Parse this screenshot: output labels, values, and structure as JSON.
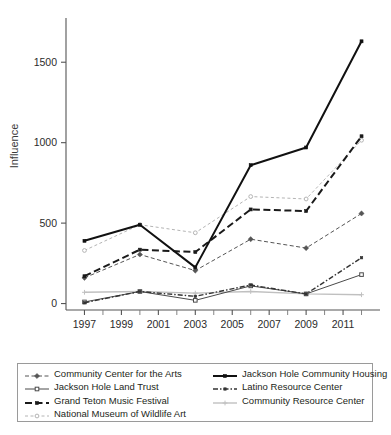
{
  "chart_data": {
    "type": "line",
    "title": "",
    "xlabel": "",
    "ylabel": "Influence",
    "x": [
      1997,
      1998,
      1999,
      2000,
      2001,
      2002,
      2003,
      2004,
      2005,
      2006,
      2007,
      2008,
      2009,
      2010,
      2011,
      2012
    ],
    "x_tick_labels": [
      "1997",
      "1999",
      "2001",
      "2003",
      "2005",
      "2007",
      "2009",
      "2011"
    ],
    "x_ticks": [
      1997,
      1999,
      2001,
      2003,
      2005,
      2007,
      2009,
      2011
    ],
    "xlim": [
      1996,
      2013
    ],
    "y_tick_labels": [
      "0",
      "500",
      "1000",
      "1500"
    ],
    "y_ticks": [
      0,
      500,
      1000,
      1500
    ],
    "ylim": [
      -40,
      1750
    ],
    "grid": false,
    "legend_position": "below",
    "series": [
      {
        "name": "Community Center for the Arts",
        "style": "dashed-thin",
        "color": "#555555",
        "marker": "diamond",
        "x": [
          1997,
          2000,
          2003,
          2006,
          2009,
          2012
        ],
        "values": [
          160,
          305,
          205,
          400,
          345,
          560
        ]
      },
      {
        "name": "Jackson Hole Land Trust",
        "style": "solid-thin",
        "color": "#4a4a4a",
        "marker": "square-open",
        "x": [
          1997,
          2000,
          2003,
          2006,
          2009,
          2012
        ],
        "values": [
          10,
          75,
          20,
          110,
          60,
          180
        ]
      },
      {
        "name": "Grand Teton Music Festival",
        "style": "dashed-bold",
        "color": "#1a1a1a",
        "marker": "square",
        "x": [
          1997,
          2000,
          2003,
          2006,
          2009,
          2012
        ],
        "values": [
          170,
          335,
          320,
          585,
          575,
          1040
        ]
      },
      {
        "name": "National Museum of Wildlife Art",
        "style": "dotted-light",
        "color": "#b4b4b4",
        "marker": "circle-open",
        "x": [
          1997,
          2000,
          2003,
          2006,
          2009,
          2012
        ],
        "values": [
          330,
          490,
          440,
          665,
          650,
          1015
        ]
      },
      {
        "name": "Jackson Hole Community Housing",
        "style": "solid-bold",
        "color": "#111111",
        "marker": "square",
        "x": [
          1997,
          2000,
          2003,
          2006,
          2009,
          2012
        ],
        "values": [
          390,
          490,
          225,
          860,
          970,
          1630
        ]
      },
      {
        "name": "Latino Resource Center",
        "style": "dash-dot",
        "color": "#333333",
        "marker": "square-small",
        "x": [
          1997,
          2000,
          2003,
          2006,
          2009,
          2012
        ],
        "values": [
          5,
          75,
          45,
          115,
          60,
          285
        ]
      },
      {
        "name": "Community Resource Center",
        "style": "solid-grey",
        "color": "#c0c0c0",
        "marker": "plus",
        "x": [
          1997,
          2000,
          2003,
          2006,
          2009,
          2012
        ],
        "values": [
          70,
          75,
          65,
          75,
          60,
          55
        ]
      }
    ]
  },
  "legend": {
    "left_column": [
      "Community Center for the Arts",
      "Jackson Hole Land Trust",
      "Grand Teton Music Festival",
      "National Museum of Wildlife Art"
    ],
    "right_column": [
      "Jackson Hole Community Housing",
      "Latino Resource Center",
      "Community Resource Center"
    ]
  }
}
